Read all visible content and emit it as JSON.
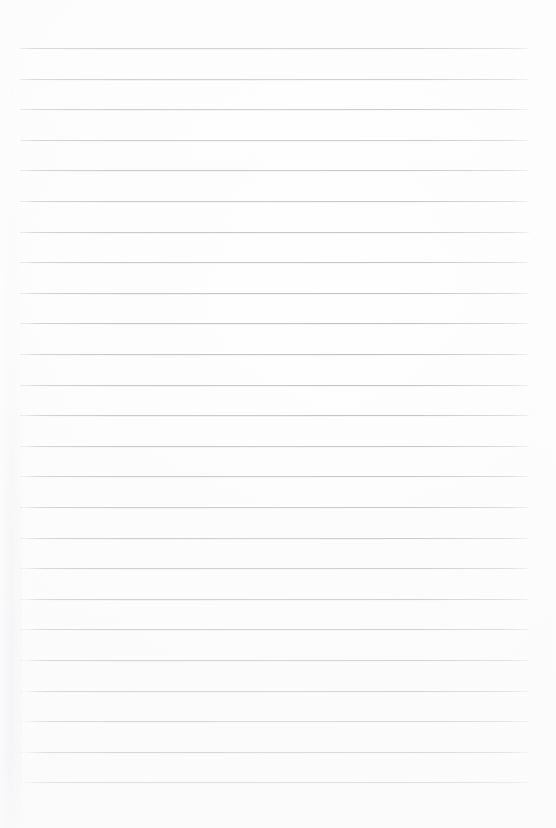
{
  "document": {
    "kind": "scanned-lined-notebook-page",
    "title": "Blank Lined Notebook Page",
    "page_width": 556,
    "page_height": 828,
    "has_text_content": false,
    "written_text": "",
    "paper_color": "#ffffff",
    "paper_tint": "#fcfcfd"
  },
  "ruling": {
    "style": "horizontal-ruled",
    "line_color": "#babac2",
    "line_thickness_px": 1,
    "line_count": 25,
    "line_left_px": 20,
    "line_right_px": 529,
    "line_width_px": 509,
    "first_line_y_px": 48,
    "last_line_y_px": 783,
    "line_spacing_px": 30.6,
    "has_vertical_margin_rule": false,
    "line_y_positions": [
      48,
      78.6,
      109.2,
      139.8,
      170.4,
      201,
      231.6,
      262.2,
      292.8,
      323.4,
      354,
      384.6,
      415.2,
      445.8,
      476.4,
      507,
      537.6,
      568.2,
      598.8,
      629.4,
      660,
      690.6,
      721.2,
      751.8,
      782.4
    ]
  },
  "gutter": {
    "present": true,
    "side": "left",
    "shadow_color": "#e6e6ec",
    "width_px": 34,
    "strongest_at": "bottom"
  }
}
